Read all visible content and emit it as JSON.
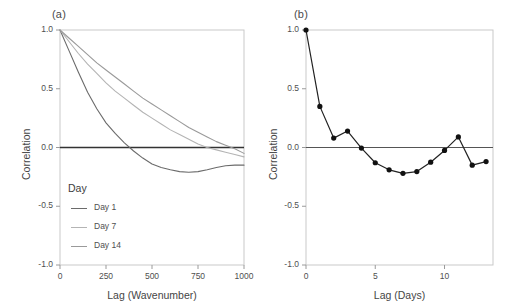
{
  "figure": {
    "width": 522,
    "height": 306,
    "background": "#ffffff"
  },
  "panel_a": {
    "label": "(a)",
    "axis": {
      "xlabel": "Lag (Wavenumber)",
      "ylabel": "Correlation",
      "xticks": [
        "0",
        "250",
        "500",
        "750",
        "1000"
      ],
      "xtick_values": [
        0,
        250,
        500,
        750,
        1000
      ],
      "yticks": [
        "1.0",
        "0.5",
        "0.0",
        "-0.5",
        "-1.0"
      ],
      "ytick_values": [
        1.0,
        0.5,
        0.0,
        -0.5,
        -1.0
      ],
      "xlim": [
        0,
        1000
      ],
      "ylim": [
        -1.0,
        1.0
      ],
      "zero_line": 0.0,
      "grid": false
    },
    "legend": {
      "title": "Day",
      "position": "inside-lower-left",
      "entries": [
        {
          "label": "Day 1",
          "color": "#6b6b6b"
        },
        {
          "label": "Day 7",
          "color": "#b4b4b4"
        },
        {
          "label": "Day 14",
          "color": "#9a9a9a"
        }
      ]
    }
  },
  "panel_b": {
    "label": "(b)",
    "axis": {
      "xlabel": "Lag (Days)",
      "ylabel": "Correlation",
      "xticks": [
        "0",
        "5",
        "10"
      ],
      "xtick_values": [
        0,
        5,
        10
      ],
      "yticks": [
        "1.0",
        "0.5",
        "0.0",
        "-0.5",
        "-1.0"
      ],
      "ytick_values": [
        1.0,
        0.5,
        0.0,
        -0.5,
        -1.0
      ],
      "xlim": [
        0,
        13.5
      ],
      "ylim": [
        -1.0,
        1.0
      ],
      "zero_line": 0.0,
      "grid": false
    },
    "marker_color": "#111111",
    "line_color": "#222222"
  },
  "chart_data": [
    {
      "type": "line",
      "panel": "(a)",
      "title": "",
      "xlabel": "Lag (Wavenumber)",
      "ylabel": "Correlation",
      "xlim": [
        0,
        1000
      ],
      "ylim": [
        -1.0,
        1.0
      ],
      "grid": false,
      "legend": "inside lower left",
      "legend_title": "Day",
      "x": [
        0,
        50,
        100,
        150,
        200,
        250,
        300,
        350,
        400,
        450,
        500,
        550,
        600,
        650,
        700,
        750,
        800,
        850,
        900,
        950,
        1000
      ],
      "series": [
        {
          "name": "Day 1",
          "color": "#6b6b6b",
          "values": [
            1.0,
            0.82,
            0.64,
            0.47,
            0.33,
            0.21,
            0.12,
            0.04,
            -0.03,
            -0.09,
            -0.14,
            -0.17,
            -0.19,
            -0.205,
            -0.21,
            -0.205,
            -0.19,
            -0.17,
            -0.155,
            -0.15,
            -0.15
          ]
        },
        {
          "name": "Day 7",
          "color": "#b4b4b4",
          "values": [
            1.0,
            0.9,
            0.8,
            0.71,
            0.63,
            0.55,
            0.48,
            0.42,
            0.36,
            0.3,
            0.25,
            0.2,
            0.15,
            0.11,
            0.07,
            0.03,
            0.0,
            -0.02,
            -0.04,
            -0.06,
            -0.08
          ]
        },
        {
          "name": "Day 14",
          "color": "#9a9a9a",
          "values": [
            1.0,
            0.93,
            0.86,
            0.79,
            0.72,
            0.66,
            0.6,
            0.54,
            0.48,
            0.42,
            0.37,
            0.32,
            0.27,
            0.22,
            0.17,
            0.13,
            0.09,
            0.05,
            0.02,
            -0.01,
            -0.05
          ]
        }
      ]
    },
    {
      "type": "line",
      "panel": "(b)",
      "title": "",
      "xlabel": "Lag (Days)",
      "ylabel": "Correlation",
      "xlim": [
        0,
        13.5
      ],
      "ylim": [
        -1.0,
        1.0
      ],
      "grid": false,
      "markers": true,
      "x": [
        0,
        1,
        2,
        3,
        4,
        5,
        6,
        7,
        8,
        9,
        10,
        11,
        12,
        13
      ],
      "values": [
        1.0,
        0.35,
        0.08,
        0.14,
        -0.005,
        -0.13,
        -0.19,
        -0.22,
        -0.205,
        -0.125,
        -0.025,
        0.09,
        -0.15,
        -0.12
      ],
      "series": [
        {
          "name": "Correlation",
          "color": "#222222",
          "values": [
            1.0,
            0.35,
            0.08,
            0.14,
            -0.005,
            -0.13,
            -0.19,
            -0.22,
            -0.205,
            -0.125,
            -0.025,
            0.09,
            -0.15,
            -0.12
          ]
        }
      ]
    }
  ]
}
